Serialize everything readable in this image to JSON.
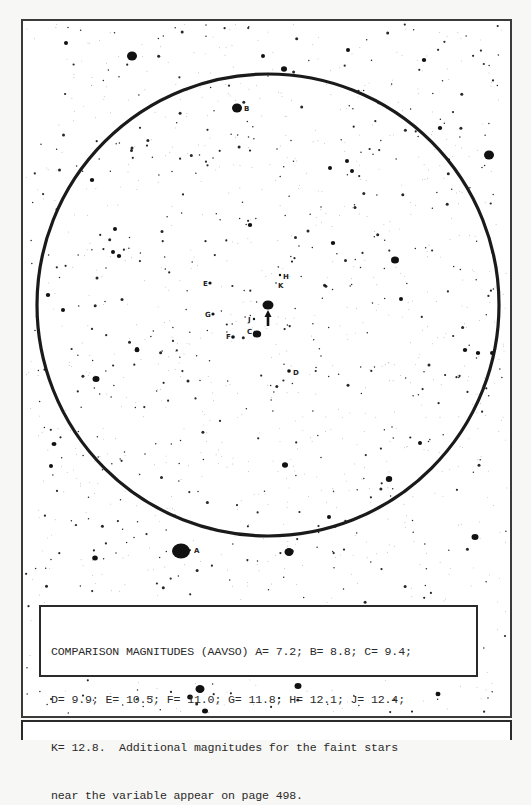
{
  "chart": {
    "frame": {
      "x": 22,
      "y": 20,
      "width": 489,
      "height": 697
    },
    "field_circle": {
      "cx": 268,
      "cy": 305,
      "rx": 231,
      "ry": 231
    },
    "variable_star": {
      "x": 268,
      "y": 305,
      "rx": 5.5,
      "ry": 4.5,
      "arrow": {
        "x": 268,
        "y_from": 326,
        "y_to": 311
      }
    },
    "comparison_stars": [
      {
        "label": "A",
        "x": 181,
        "y": 551,
        "rx": 9,
        "ry": 7.5,
        "lx": 194,
        "ly": 553
      },
      {
        "label": "B",
        "x": 237,
        "y": 108,
        "rx": 5,
        "ry": 4.5,
        "lx": 244,
        "ly": 111
      },
      {
        "label": "C",
        "x": 257,
        "y": 334,
        "rx": 4.2,
        "ry": 3.6,
        "lx": 247,
        "ly": 334
      },
      {
        "label": "D",
        "x": 289,
        "y": 371,
        "rx": 1.8,
        "ry": 1.8,
        "lx": 293,
        "ly": 375
      },
      {
        "label": "E",
        "x": 210,
        "y": 283,
        "rx": 1.6,
        "ry": 1.6,
        "lx": 203,
        "ly": 286
      },
      {
        "label": "F",
        "x": 233,
        "y": 337,
        "rx": 1.8,
        "ry": 1.8,
        "lx": 226,
        "ly": 339
      },
      {
        "label": "G",
        "x": 213,
        "y": 314,
        "rx": 1.6,
        "ry": 1.6,
        "lx": 205,
        "ly": 317
      },
      {
        "label": "H",
        "x": 280,
        "y": 275,
        "rx": 1.2,
        "ry": 1.2,
        "lx": 283,
        "ly": 279
      },
      {
        "label": "J",
        "x": 254,
        "y": 319,
        "rx": 1.2,
        "ry": 1.2,
        "lx": 248,
        "ly": 322
      },
      {
        "label": "K",
        "x": 276,
        "y": 283,
        "rx": 0.8,
        "ry": 0.8,
        "lx": 278,
        "ly": 288
      }
    ],
    "bright_stars": [
      [
        132,
        56,
        5,
        4.5
      ],
      [
        489,
        155,
        5,
        4.5
      ],
      [
        395,
        260,
        4,
        3.5
      ],
      [
        96,
        379,
        3.5,
        3
      ],
      [
        285,
        465,
        3,
        2.8
      ],
      [
        389,
        479,
        3.2,
        3
      ],
      [
        289,
        552,
        4.5,
        4
      ],
      [
        475,
        537,
        3.5,
        3
      ],
      [
        95,
        558,
        2.8,
        2.5
      ],
      [
        200,
        689,
        4.5,
        4
      ],
      [
        190,
        697,
        2.8,
        2.5
      ],
      [
        298,
        686,
        3.5,
        3
      ],
      [
        205,
        711,
        3,
        2.5
      ],
      [
        438,
        694,
        2.5,
        2.2
      ],
      [
        284,
        69,
        3,
        2.8
      ],
      [
        333,
        243,
        2.2,
        2
      ],
      [
        250,
        225,
        2.2,
        2
      ],
      [
        347,
        161,
        2,
        2
      ],
      [
        92,
        180,
        2.2,
        2
      ],
      [
        119,
        256,
        2.2,
        2
      ],
      [
        113,
        252,
        2,
        2
      ],
      [
        137,
        350,
        2.5,
        2.2
      ],
      [
        48,
        295,
        2.2,
        2
      ],
      [
        465,
        350,
        2.2,
        2
      ],
      [
        478,
        353,
        2.2,
        2
      ],
      [
        492,
        353,
        2,
        2
      ],
      [
        420,
        443,
        2,
        2
      ],
      [
        401,
        299,
        2,
        2
      ],
      [
        352,
        171,
        2,
        2
      ],
      [
        440,
        128,
        2.2,
        2
      ],
      [
        424,
        60,
        2.2,
        2
      ],
      [
        348,
        50,
        2,
        2
      ],
      [
        330,
        168,
        2,
        2
      ],
      [
        263,
        56,
        2,
        2
      ],
      [
        66,
        43,
        2,
        2
      ],
      [
        115,
        229,
        2,
        2
      ],
      [
        63,
        310,
        2,
        2
      ],
      [
        137,
        349,
        2,
        2
      ],
      [
        54,
        444,
        2.5,
        2
      ],
      [
        51,
        466,
        2,
        2
      ],
      [
        329,
        517,
        2,
        2
      ],
      [
        127,
        609,
        2,
        2
      ],
      [
        86,
        646,
        2,
        2
      ]
    ]
  },
  "caption": {
    "lines": [
      "COMPARISON MAGNITUDES (AAVSO) A= 7.2; B= 8.8; C= 9.4;",
      "D= 9.9; E= 10.5; F= 11.0; G= 11.8; H= 12.1; J= 12.4;",
      "K= 12.8.  Additional magnitudes for the faint stars",
      "near the variable appear on page 498."
    ]
  },
  "magnitudes": [
    {
      "star": "A",
      "mag": 7.2
    },
    {
      "star": "B",
      "mag": 8.8
    },
    {
      "star": "C",
      "mag": 9.4
    },
    {
      "star": "D",
      "mag": 9.9
    },
    {
      "star": "E",
      "mag": 10.5
    },
    {
      "star": "F",
      "mag": 11.0
    },
    {
      "star": "G",
      "mag": 11.8
    },
    {
      "star": "H",
      "mag": 12.1
    },
    {
      "star": "J",
      "mag": 12.4
    },
    {
      "star": "K",
      "mag": 12.8
    }
  ],
  "colors": {
    "ink": "#111111",
    "paper": "#ffffff",
    "frame": "#3a3a3a"
  }
}
